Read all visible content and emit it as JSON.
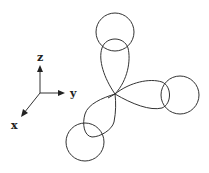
{
  "diagram": {
    "axes": {
      "z_label": "z",
      "y_label": "y",
      "x_label": "x"
    },
    "lobes": [
      "top",
      "right",
      "bottom-left"
    ],
    "circles": [
      "top-circle",
      "right-circle",
      "bottom-left-circle"
    ],
    "stroke_color": "#333333"
  }
}
